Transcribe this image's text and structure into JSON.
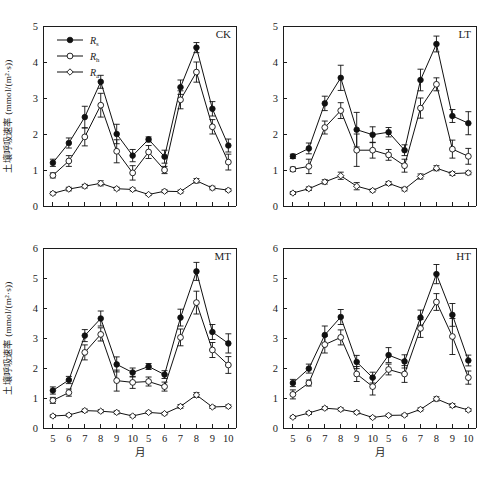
{
  "figure": {
    "caption_remnant": "",
    "y_axis_label": "土壤呼吸速率 (mmol/(m²·s))",
    "x_axis_label": "月",
    "series_legend": [
      {
        "key": "Rs",
        "base": "R",
        "sub": "s",
        "marker": "filled-circle"
      },
      {
        "key": "Rh",
        "base": "R",
        "sub": "h",
        "marker": "open-circle"
      },
      {
        "key": "Ra",
        "base": "R",
        "sub": "a",
        "marker": "open-diamond"
      }
    ]
  },
  "chart_data": [
    {
      "type": "line",
      "title": "CK",
      "xlabel": "月",
      "ylabel": "土壤呼吸速率 (mmol/(m²·s))",
      "ylim": [
        0,
        5
      ],
      "yticks": [
        0,
        1,
        2,
        3,
        4,
        5
      ],
      "grid": false,
      "legend_position": "top-left",
      "categories": [
        "5",
        "6",
        "7",
        "8",
        "9",
        "10",
        "5",
        "6",
        "7",
        "8",
        "9",
        "10"
      ],
      "series": [
        {
          "name": "Rs",
          "values": [
            1.2,
            1.75,
            2.47,
            3.45,
            2.0,
            1.4,
            1.85,
            1.37,
            3.3,
            4.4,
            2.7,
            1.68
          ],
          "errors": [
            0.1,
            0.14,
            0.3,
            0.18,
            0.27,
            0.17,
            0.07,
            0.18,
            0.2,
            0.14,
            0.2,
            0.18
          ]
        },
        {
          "name": "Rh",
          "values": [
            0.85,
            1.25,
            1.92,
            2.8,
            1.52,
            0.92,
            1.5,
            1.0,
            2.95,
            3.72,
            2.2,
            1.22
          ],
          "errors": [
            0.07,
            0.15,
            0.25,
            0.33,
            0.32,
            0.2,
            0.18,
            0.1,
            0.25,
            0.28,
            0.2,
            0.22
          ]
        },
        {
          "name": "Ra",
          "values": [
            0.35,
            0.47,
            0.55,
            0.63,
            0.48,
            0.46,
            0.32,
            0.41,
            0.4,
            0.7,
            0.5,
            0.44
          ],
          "errors": [
            0.04,
            0.05,
            0.05,
            0.07,
            0.04,
            0.04,
            0.03,
            0.04,
            0.04,
            0.06,
            0.05,
            0.04
          ]
        }
      ]
    },
    {
      "type": "line",
      "title": "LT",
      "xlabel": "月",
      "ylabel": "土壤呼吸速率 (mmol/(m²·s))",
      "ylim": [
        0,
        5
      ],
      "yticks": [
        0,
        1,
        2,
        3,
        4,
        5
      ],
      "grid": false,
      "legend_position": "none",
      "categories": [
        "5",
        "6",
        "7",
        "8",
        "9",
        "10",
        "5",
        "6",
        "7",
        "8",
        "9",
        "10"
      ],
      "series": [
        {
          "name": "Rs",
          "values": [
            1.38,
            1.6,
            2.85,
            3.56,
            2.12,
            1.98,
            2.05,
            1.55,
            3.5,
            4.5,
            2.5,
            2.3
          ],
          "errors": [
            0.06,
            0.15,
            0.2,
            0.35,
            0.48,
            0.22,
            0.13,
            0.15,
            0.3,
            0.22,
            0.18,
            0.32
          ]
        },
        {
          "name": "Rh",
          "values": [
            1.02,
            1.1,
            2.18,
            2.65,
            1.55,
            1.55,
            1.42,
            1.12,
            2.72,
            3.38,
            1.58,
            1.38
          ],
          "errors": [
            0.06,
            0.2,
            0.18,
            0.22,
            0.45,
            0.22,
            0.15,
            0.18,
            0.28,
            0.18,
            0.25,
            0.22
          ]
        },
        {
          "name": "Ra",
          "values": [
            0.36,
            0.48,
            0.67,
            0.84,
            0.55,
            0.43,
            0.63,
            0.47,
            0.82,
            1.05,
            0.9,
            0.92
          ],
          "errors": [
            0.04,
            0.05,
            0.06,
            0.1,
            0.1,
            0.04,
            0.05,
            0.05,
            0.07,
            0.07,
            0.05,
            0.05
          ]
        }
      ]
    },
    {
      "type": "line",
      "title": "MT",
      "xlabel": "月",
      "ylabel": "土壤呼吸速率 (mmol/(m²·s))",
      "ylim": [
        0,
        6
      ],
      "yticks": [
        0,
        1,
        2,
        3,
        4,
        5,
        6
      ],
      "grid": false,
      "legend_position": "none",
      "categories": [
        "5",
        "6",
        "7",
        "8",
        "9",
        "10",
        "5",
        "6",
        "7",
        "8",
        "9",
        "10"
      ],
      "series": [
        {
          "name": "Rs",
          "values": [
            1.25,
            1.6,
            3.08,
            3.65,
            2.12,
            1.85,
            2.05,
            1.78,
            3.68,
            5.22,
            3.2,
            2.82
          ],
          "errors": [
            0.12,
            0.12,
            0.2,
            0.25,
            0.25,
            0.15,
            0.1,
            0.13,
            0.28,
            0.3,
            0.25,
            0.32
          ]
        },
        {
          "name": "Rh",
          "values": [
            0.92,
            1.18,
            2.52,
            3.12,
            1.58,
            1.52,
            1.55,
            1.38,
            3.02,
            4.18,
            2.6,
            2.1
          ],
          "errors": [
            0.1,
            0.12,
            0.25,
            0.22,
            0.35,
            0.2,
            0.15,
            0.15,
            0.28,
            0.38,
            0.25,
            0.28
          ]
        },
        {
          "name": "Ra",
          "values": [
            0.4,
            0.43,
            0.58,
            0.56,
            0.52,
            0.4,
            0.52,
            0.48,
            0.72,
            1.1,
            0.7,
            0.72
          ],
          "errors": [
            0.04,
            0.04,
            0.05,
            0.05,
            0.05,
            0.04,
            0.04,
            0.04,
            0.06,
            0.08,
            0.05,
            0.05
          ]
        }
      ]
    },
    {
      "type": "line",
      "title": "HT",
      "xlabel": "月",
      "ylabel": "土壤呼吸速率 (mmol/(m²·s))",
      "ylim": [
        0,
        6
      ],
      "yticks": [
        0,
        1,
        2,
        3,
        4,
        5,
        6
      ],
      "grid": false,
      "legend_position": "none",
      "categories": [
        "5",
        "6",
        "7",
        "8",
        "9",
        "10",
        "5",
        "6",
        "7",
        "8",
        "9",
        "10"
      ],
      "series": [
        {
          "name": "Rs",
          "values": [
            1.5,
            1.98,
            3.1,
            3.7,
            2.2,
            1.68,
            2.43,
            2.22,
            3.68,
            5.13,
            3.77,
            2.25
          ],
          "errors": [
            0.12,
            0.15,
            0.3,
            0.25,
            0.22,
            0.18,
            0.25,
            0.22,
            0.25,
            0.32,
            0.38,
            0.18
          ]
        },
        {
          "name": "Rh",
          "values": [
            1.12,
            1.5,
            2.78,
            3.02,
            1.8,
            1.38,
            1.95,
            1.8,
            3.32,
            4.2,
            3.05,
            1.68
          ],
          "errors": [
            0.15,
            0.1,
            0.28,
            0.25,
            0.25,
            0.28,
            0.18,
            0.28,
            0.3,
            0.28,
            0.6,
            0.22
          ]
        },
        {
          "name": "Ra",
          "values": [
            0.36,
            0.5,
            0.66,
            0.62,
            0.52,
            0.35,
            0.42,
            0.43,
            0.62,
            0.97,
            0.75,
            0.6
          ],
          "errors": [
            0.04,
            0.05,
            0.05,
            0.05,
            0.05,
            0.04,
            0.04,
            0.04,
            0.05,
            0.07,
            0.06,
            0.05
          ]
        }
      ]
    }
  ]
}
